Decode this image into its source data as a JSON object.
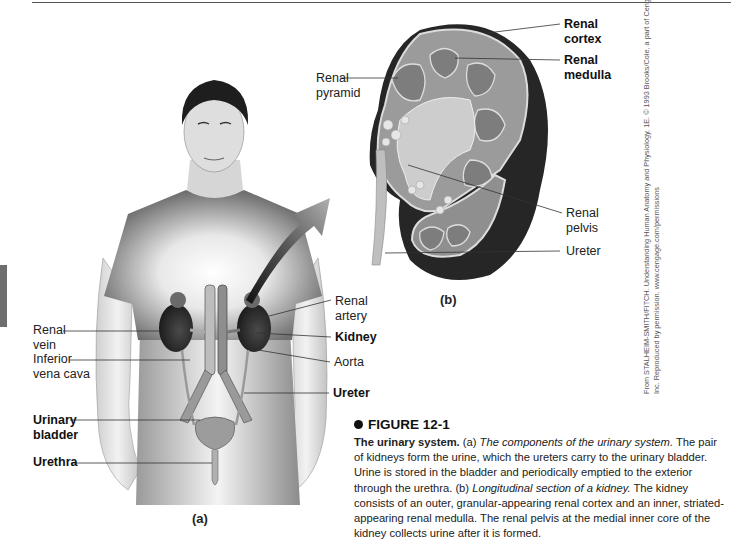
{
  "figure": {
    "number": "FIGURE 12-1",
    "panel_a_label": "(a)",
    "panel_b_label": "(b)",
    "panel_a_labels": {
      "renal_vein": [
        "Renal",
        "vein"
      ],
      "inferior_vena_cava": [
        "Inferior",
        "vena cava"
      ],
      "urinary_bladder": [
        "Urinary",
        "bladder"
      ],
      "urethra": "Urethra",
      "renal_artery": [
        "Renal",
        "artery"
      ],
      "kidney": "Kidney",
      "aorta": "Aorta",
      "ureter": "Ureter"
    },
    "panel_b_labels": {
      "renal_pyramid": [
        "Renal",
        "pyramid"
      ],
      "renal_cortex": [
        "Renal",
        "cortex"
      ],
      "renal_medulla": [
        "Renal",
        "medulla"
      ],
      "renal_pelvis": [
        "Renal",
        "pelvis"
      ],
      "ureter": "Ureter"
    },
    "credit": {
      "line1": "From STALHEIM-SMITH/FITCH. Understanding Human Anatomy and Physiology, 1E. © 1993 Brooks/Cole, a part of Cengage Learning,",
      "line2": "Inc. Reproduced by permission. www.cengage.com/permissions"
    },
    "caption": {
      "title_bold": "The urinary system.",
      "a_marker": "(a)",
      "a_italic": "The components of the urinary system.",
      "a_text": "The pair of kidneys form the urine, which the ureters carry to the urinary bladder. Urine is stored in the bladder and periodically emptied to the exterior through the urethra.",
      "b_marker": "(b)",
      "b_italic": "Longitudinal section of a kidney.",
      "b_text": "The kidney consists of an outer, granular-appearing renal cortex and an inner, striated-appearing renal medulla. The renal pelvis at the medial inner core of the kidney collects urine after it is formed."
    }
  }
}
